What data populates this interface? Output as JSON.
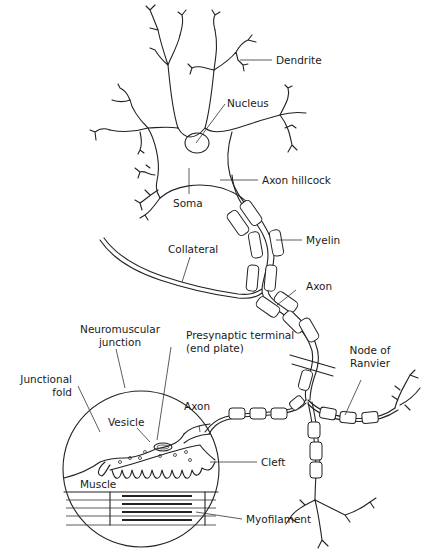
{
  "diagram": {
    "labels": {
      "dendrite": "Dendrite",
      "nucleus": "Nucleus",
      "axon_hillcock": "Axon hillcock",
      "soma": "Soma",
      "myelin": "Myelin",
      "collateral": "Collateral",
      "axon_upper": "Axon",
      "neuromuscular_junction_line1": "Neuromuscular",
      "neuromuscular_junction_line2": "junction",
      "presynaptic_line1": "Presynaptic terminal",
      "presynaptic_line2": "(end plate)",
      "node_of_ranvier_line1": "Node of",
      "node_of_ranvier_line2": "Ranvier",
      "junctional_fold_line1": "Junctional",
      "junctional_fold_line2": "fold",
      "vesicle": "Vesicle",
      "axon_inset": "Axon",
      "cleft": "Cleft",
      "muscle": "Muscle",
      "myofilament": "Myofilament"
    },
    "colors": {
      "stroke": "#222222",
      "background": "#ffffff"
    }
  }
}
